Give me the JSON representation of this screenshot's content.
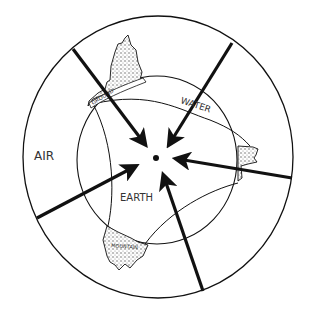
{
  "diagram": {
    "labels": {
      "air": "AIR",
      "water": "WATER",
      "earth": "EARTH",
      "ground": "GROUND",
      "mountain": "MOUNTAIN"
    },
    "colors": {
      "ink": "#111111",
      "background": "#ffffff",
      "stipple": "#bbbbbb"
    }
  }
}
